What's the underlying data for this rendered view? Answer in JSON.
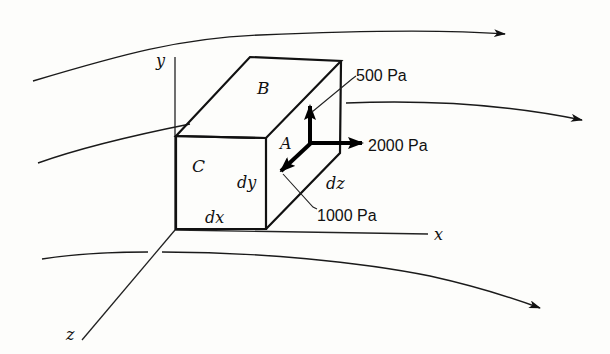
{
  "diagram": {
    "type": "fluid-element-stress-diagram",
    "axes": {
      "x_label": "x",
      "y_label": "y",
      "z_label": "z"
    },
    "faces": {
      "top": "B",
      "front": "C",
      "right": "A"
    },
    "dimensions": {
      "width": "dx",
      "height": "dy",
      "depth": "dz"
    },
    "forces": [
      {
        "direction": "+y",
        "label": "500 Pa"
      },
      {
        "direction": "+x",
        "label": "2000 Pa"
      },
      {
        "direction": "+z",
        "label": "1000 Pa"
      }
    ],
    "streamlines": [
      {
        "name": "top",
        "arrow": true
      },
      {
        "name": "middle",
        "arrow": true
      },
      {
        "name": "bottom",
        "arrow": true
      }
    ],
    "colors": {
      "ink": "#111111",
      "background": "#fdfdfb"
    }
  }
}
